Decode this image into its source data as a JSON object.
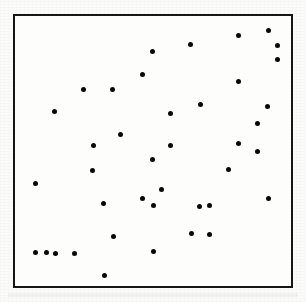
{
  "figure": {
    "title": "",
    "caption": "",
    "frame": {
      "border_color": "#161616",
      "border_width_px": 2,
      "background_color": "#fdfdfb",
      "left_px": 13,
      "top_px": 14,
      "width_px": 280,
      "height_px": 274
    },
    "page_background_color": "#fbfbf9",
    "point_color": "#080808",
    "point_diameter_px": 5,
    "point_count": 40
  },
  "chart_data": {
    "type": "scatter",
    "title": "",
    "subtitle": "",
    "xlabel": "",
    "ylabel": "",
    "xlim": [
      0,
      280
    ],
    "ylim": [
      0,
      274
    ],
    "grid": false,
    "legend": false,
    "axis_ticks": false,
    "axis_tick_labels": [],
    "annotations": [],
    "series": [
      {
        "name": "points",
        "marker": "filled-circle",
        "color": "#080808",
        "x": [
          257,
          227,
          178,
          139,
          266,
          266,
          129,
          99,
          227,
          256,
          69,
          40,
          188,
          158,
          107,
          80,
          246,
          158,
          139,
          227,
          79,
          246,
          257,
          217,
          187,
          149,
          129,
          21,
          100,
          32,
          60,
          179,
          197,
          140,
          21,
          41,
          91,
          140,
          197,
          90
        ],
        "y": [
          15,
          20,
          29,
          36,
          30,
          44,
          59,
          75,
          66,
          92,
          75,
          97,
          90,
          99,
          120,
          131,
          109,
          131,
          146,
          129,
          157,
          138,
          185,
          156,
          193,
          176,
          185,
          170,
          224,
          240,
          241,
          221,
          192,
          239,
          240,
          241,
          263,
          192,
          222,
          190
        ]
      }
    ]
  }
}
